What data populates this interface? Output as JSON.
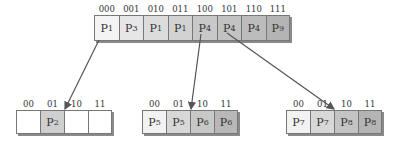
{
  "directory": {
    "labels": [
      "000",
      "001",
      "010",
      "011",
      "100",
      "101",
      "110",
      "111"
    ],
    "cells": [
      {
        "base": "P",
        "sub": "1",
        "color": "#f4f4f4"
      },
      {
        "base": "P",
        "sub": "3",
        "color": "#e6e6e6"
      },
      {
        "base": "P",
        "sub": "1",
        "color": "#dcdcdc"
      },
      {
        "base": "P",
        "sub": "1",
        "color": "#d2d2d2"
      },
      {
        "base": "P",
        "sub": "4",
        "color": "#c8c8c8"
      },
      {
        "base": "P",
        "sub": "4",
        "color": "#c2c2c2"
      },
      {
        "base": "P",
        "sub": "4",
        "color": "#bcbcbc"
      },
      {
        "base": "P",
        "sub": "9",
        "color": "#b4b4b4"
      }
    ]
  },
  "buckets": [
    {
      "labels": [
        "00",
        "01",
        "10",
        "11"
      ],
      "cells": [
        {
          "base": "",
          "sub": "",
          "color": "#ffffff"
        },
        {
          "base": "P",
          "sub": "2",
          "color": "#cfcfcf"
        },
        {
          "base": "",
          "sub": "",
          "color": "#ffffff"
        },
        {
          "base": "",
          "sub": "",
          "color": "#ffffff"
        }
      ]
    },
    {
      "labels": [
        "00",
        "01",
        "10",
        "11"
      ],
      "cells": [
        {
          "base": "P",
          "sub": "5",
          "color": "#f2f2f2"
        },
        {
          "base": "P",
          "sub": "5",
          "color": "#d8d8d8"
        },
        {
          "base": "P",
          "sub": "6",
          "color": "#c8c8c8"
        },
        {
          "base": "P",
          "sub": "6",
          "color": "#b8b8b8"
        }
      ]
    },
    {
      "labels": [
        "00",
        "01",
        "10",
        "11"
      ],
      "cells": [
        {
          "base": "P",
          "sub": "7",
          "color": "#f2f2f2"
        },
        {
          "base": "P",
          "sub": "7",
          "color": "#d8d8d8"
        },
        {
          "base": "P",
          "sub": "8",
          "color": "#c4c4c4"
        },
        {
          "base": "P",
          "sub": "8",
          "color": "#b4b4b4"
        }
      ]
    }
  ],
  "arrows": [
    {
      "from": "directory cell 000",
      "to": "bucket 1 (between 01 and 10)"
    },
    {
      "from": "directory cell 100",
      "to": "bucket 2 (between 01 and 10)"
    },
    {
      "from": "directory cell 101",
      "to": "bucket 3 (between 01 and 10)"
    }
  ]
}
